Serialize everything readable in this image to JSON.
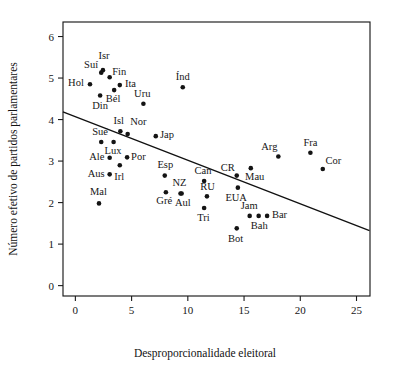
{
  "chart_data": {
    "type": "scatter",
    "title": "",
    "xlabel": "Desproporcionalidade eleitoral",
    "ylabel": "Número efetivo de partidos parlamentares",
    "xlim": [
      -1.1,
      26.2
    ],
    "ylim": [
      -0.25,
      6.35
    ],
    "xticks": [
      0,
      5,
      10,
      15,
      20,
      25
    ],
    "yticks": [
      0,
      1,
      2,
      3,
      4,
      5,
      6
    ],
    "xtick_labels": [
      "0",
      "5",
      "10",
      "15",
      "20",
      "25"
    ],
    "ytick_labels": [
      "0",
      "1",
      "2",
      "3",
      "4",
      "5",
      "6"
    ],
    "grid": false,
    "legend": false,
    "marker": "filled-circle",
    "marker_color": "#141414",
    "trend_line": {
      "type": "linear-regression",
      "x_start": -1.05,
      "y_start": 4.18,
      "x_end": 26.1,
      "y_end": 1.33,
      "color": "#111111"
    },
    "points": [
      {
        "label": "Isr",
        "x": 2.45,
        "y": 5.19,
        "lx": 2.55,
        "ly": 5.52,
        "anchor": "middle"
      },
      {
        "label": "Suí",
        "x": 2.3,
        "y": 5.13,
        "lx": 1.4,
        "ly": 5.31,
        "anchor": "middle"
      },
      {
        "label": "Fin",
        "x": 3.05,
        "y": 5.02,
        "lx": 3.9,
        "ly": 5.15,
        "anchor": "middle"
      },
      {
        "label": "Hol",
        "x": 1.3,
        "y": 4.85,
        "lx": 0.05,
        "ly": 4.88,
        "anchor": "middle"
      },
      {
        "label": "Ita",
        "x": 3.95,
        "y": 4.83,
        "lx": 4.9,
        "ly": 4.86,
        "anchor": "middle"
      },
      {
        "label": "Bél",
        "x": 3.45,
        "y": 4.71,
        "lx": 3.35,
        "ly": 4.49,
        "anchor": "middle"
      },
      {
        "label": "Din",
        "x": 2.2,
        "y": 4.58,
        "lx": 2.2,
        "ly": 4.33,
        "anchor": "middle"
      },
      {
        "label": "Uru",
        "x": 6.05,
        "y": 4.38,
        "lx": 5.95,
        "ly": 4.62,
        "anchor": "middle"
      },
      {
        "label": "Índ",
        "x": 9.55,
        "y": 4.78,
        "lx": 9.55,
        "ly": 5.02,
        "anchor": "middle"
      },
      {
        "label": "Isl",
        "x": 4.0,
        "y": 3.72,
        "lx": 3.85,
        "ly": 3.97,
        "anchor": "middle"
      },
      {
        "label": "Nor",
        "x": 4.65,
        "y": 3.65,
        "lx": 5.6,
        "ly": 3.94,
        "anchor": "middle"
      },
      {
        "label": "Jap",
        "x": 7.15,
        "y": 3.6,
        "lx": 8.15,
        "ly": 3.63,
        "anchor": "middle"
      },
      {
        "label": "Sué",
        "x": 2.3,
        "y": 3.46,
        "lx": 2.2,
        "ly": 3.7,
        "anchor": "middle"
      },
      {
        "label": "Lux",
        "x": 3.4,
        "y": 3.46,
        "lx": 3.35,
        "ly": 3.25,
        "anchor": "middle"
      },
      {
        "label": "Ale",
        "x": 3.05,
        "y": 3.08,
        "lx": 1.9,
        "ly": 3.11,
        "anchor": "middle"
      },
      {
        "label": "Por",
        "x": 4.6,
        "y": 3.09,
        "lx": 5.6,
        "ly": 3.11,
        "anchor": "middle"
      },
      {
        "label": "Irl",
        "x": 3.95,
        "y": 2.9,
        "lx": 3.9,
        "ly": 2.62,
        "anchor": "middle"
      },
      {
        "label": "Aus",
        "x": 3.05,
        "y": 2.68,
        "lx": 1.85,
        "ly": 2.7,
        "anchor": "middle"
      },
      {
        "label": "Esp",
        "x": 7.95,
        "y": 2.65,
        "lx": 8.0,
        "ly": 2.9,
        "anchor": "middle"
      },
      {
        "label": "Mal",
        "x": 2.1,
        "y": 1.98,
        "lx": 2.05,
        "ly": 2.25,
        "anchor": "middle"
      },
      {
        "label": "Gré",
        "x": 8.05,
        "y": 2.25,
        "lx": 7.9,
        "ly": 2.03,
        "anchor": "middle"
      },
      {
        "label": "NZ",
        "x": 9.35,
        "y": 2.22,
        "lx": 9.25,
        "ly": 2.47,
        "anchor": "middle"
      },
      {
        "label": "Aul",
        "x": 9.45,
        "y": 2.22,
        "lx": 9.55,
        "ly": 1.98,
        "anchor": "middle"
      },
      {
        "label": "Can",
        "x": 11.45,
        "y": 2.52,
        "lx": 11.35,
        "ly": 2.76,
        "anchor": "middle"
      },
      {
        "label": "RU",
        "x": 11.7,
        "y": 2.15,
        "lx": 11.75,
        "ly": 2.38,
        "anchor": "middle"
      },
      {
        "label": "Tri",
        "x": 11.45,
        "y": 1.87,
        "lx": 11.4,
        "ly": 1.63,
        "anchor": "middle"
      },
      {
        "label": "CR",
        "x": 14.35,
        "y": 2.65,
        "lx": 13.55,
        "ly": 2.84,
        "anchor": "middle"
      },
      {
        "label": "Mau",
        "x": 15.6,
        "y": 2.83,
        "lx": 15.95,
        "ly": 2.61,
        "anchor": "middle"
      },
      {
        "label": "EUA",
        "x": 14.45,
        "y": 2.36,
        "lx": 14.3,
        "ly": 2.11,
        "anchor": "middle"
      },
      {
        "label": "Bot",
        "x": 14.35,
        "y": 1.38,
        "lx": 14.25,
        "ly": 1.13,
        "anchor": "middle"
      },
      {
        "label": "Jam",
        "x": 15.5,
        "y": 1.68,
        "lx": 15.45,
        "ly": 1.92,
        "anchor": "middle"
      },
      {
        "label": "Bah",
        "x": 16.3,
        "y": 1.68,
        "lx": 16.35,
        "ly": 1.44,
        "anchor": "middle"
      },
      {
        "label": "Bar",
        "x": 17.05,
        "y": 1.68,
        "lx": 18.15,
        "ly": 1.69,
        "anchor": "middle"
      },
      {
        "label": "Arg",
        "x": 18.05,
        "y": 3.11,
        "lx": 17.25,
        "ly": 3.33,
        "anchor": "middle"
      },
      {
        "label": "Fra",
        "x": 20.9,
        "y": 3.2,
        "lx": 20.9,
        "ly": 3.44,
        "anchor": "middle"
      },
      {
        "label": "Cor",
        "x": 22.0,
        "y": 2.81,
        "lx": 22.95,
        "ly": 3.0,
        "anchor": "middle"
      }
    ]
  }
}
